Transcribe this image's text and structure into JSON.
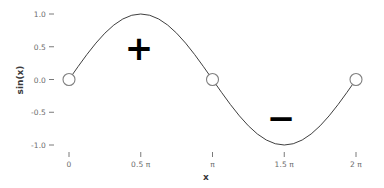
{
  "chart_data": {
    "type": "line",
    "title": "",
    "xlabel": "x",
    "ylabel": "sin(x)",
    "xlim": [
      0,
      6.283185307179586
    ],
    "ylim": [
      -1.08,
      1.08
    ],
    "grid": false,
    "legend": null,
    "series": [
      {
        "name": "sin(x)",
        "color": "#3f3f3f",
        "x": [
          0.0,
          0.19634954,
          0.39269908,
          0.58904862,
          0.78539816,
          0.9817477,
          1.17809725,
          1.37444679,
          1.57079633,
          1.76714587,
          1.96349541,
          2.15984495,
          2.35619449,
          2.55254403,
          2.74889357,
          2.94524311,
          3.14159265,
          3.33794219,
          3.53429174,
          3.73064128,
          3.92699082,
          4.12334036,
          4.3196899,
          4.51603944,
          4.71238898,
          4.90873852,
          5.10508806,
          5.3014376,
          5.49778714,
          5.69413668,
          5.89048623,
          6.08683577,
          6.28318531
        ],
        "y": [
          0.0,
          0.19509,
          0.38268,
          0.55557,
          0.70711,
          0.83147,
          0.92388,
          0.98079,
          1.0,
          0.98079,
          0.92388,
          0.83147,
          0.70711,
          0.55557,
          0.38268,
          0.19509,
          0.0,
          -0.19509,
          -0.38268,
          -0.55557,
          -0.70711,
          -0.83147,
          -0.92388,
          -0.98079,
          -1.0,
          -0.98079,
          -0.92388,
          -0.83147,
          -0.70711,
          -0.55557,
          -0.38268,
          -0.19509,
          0.0
        ]
      }
    ],
    "markers": [
      {
        "x": 0.0,
        "y": 0.0,
        "shape": "open-circle"
      },
      {
        "x": 3.14159265,
        "y": 0.0,
        "shape": "open-circle"
      },
      {
        "x": 6.28318531,
        "y": 0.0,
        "shape": "open-circle"
      }
    ],
    "annotations": [
      {
        "text": "+",
        "x": 1.57079633,
        "y": 0.5,
        "name": "positive-half-sign"
      },
      {
        "text": "−",
        "x": 4.71238898,
        "y": -0.58,
        "name": "negative-half-sign"
      }
    ],
    "xticks": [
      {
        "value": 0.0,
        "label": "0"
      },
      {
        "value": 1.57079633,
        "label": "0.5 π"
      },
      {
        "value": 3.14159265,
        "label": "π"
      },
      {
        "value": 4.71238898,
        "label": "1.5 π"
      },
      {
        "value": 6.28318531,
        "label": "2 π"
      }
    ],
    "yticks": [
      {
        "value": 1.0,
        "label": "1.0"
      },
      {
        "value": 0.5,
        "label": "0.5"
      },
      {
        "value": 0.0,
        "label": "0.0"
      },
      {
        "value": -0.5,
        "label": "-0.5"
      },
      {
        "value": -1.0,
        "label": "-1.0"
      }
    ],
    "colors": {
      "background": "#ffffff",
      "line": "#3f3f3f",
      "marker_edge": "#808080",
      "marker_fill": "#ffffff",
      "tick_text": "#6b6b6b",
      "axis_title": "#3a3a3a",
      "annotation": "#000000"
    }
  }
}
